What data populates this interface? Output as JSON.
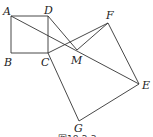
{
  "figure": {
    "caption": "图18-2-3",
    "points": {
      "A": {
        "label": "A",
        "x": 11,
        "y": 16
      },
      "B": {
        "label": "B",
        "x": 11,
        "y": 53
      },
      "C": {
        "label": "C",
        "x": 48,
        "y": 53
      },
      "D": {
        "label": "D",
        "x": 48,
        "y": 16
      },
      "E": {
        "label": "E",
        "x": 139,
        "y": 84
      },
      "F": {
        "label": "F",
        "x": 108,
        "y": 23
      },
      "G": {
        "label": "G",
        "x": 79,
        "y": 121
      },
      "M": {
        "label": "M",
        "x": 77,
        "y": 50
      }
    },
    "segments": [
      [
        "A",
        "D"
      ],
      [
        "D",
        "C"
      ],
      [
        "C",
        "B"
      ],
      [
        "B",
        "A"
      ],
      [
        "C",
        "F"
      ],
      [
        "F",
        "E"
      ],
      [
        "E",
        "G"
      ],
      [
        "G",
        "C"
      ],
      [
        "A",
        "E"
      ],
      [
        "D",
        "M"
      ],
      [
        "M",
        "F"
      ]
    ]
  }
}
